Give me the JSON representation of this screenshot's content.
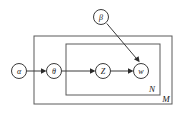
{
  "diagram": {
    "type": "plate-notation-graphical-model",
    "title": "",
    "colors": {
      "background": "#ffffff",
      "node_stroke": "#3b3b3b",
      "node_fill": "#ffffff",
      "plate_stroke": "#5a5a5a",
      "edge_stroke": "#3b3b3b",
      "text": "#1a1a1a"
    },
    "nodes": [
      {
        "id": "alpha",
        "label": "α",
        "cx": 19,
        "cy": 71,
        "r": 7.5
      },
      {
        "id": "theta",
        "label": "θ",
        "cx": 54,
        "cy": 71,
        "r": 7.5
      },
      {
        "id": "z",
        "label": "Z",
        "cx": 103,
        "cy": 71,
        "r": 7.5
      },
      {
        "id": "w",
        "label": "w",
        "cx": 141,
        "cy": 71,
        "r": 7.5
      },
      {
        "id": "beta",
        "label": "β",
        "cx": 101,
        "cy": 17,
        "r": 7.5
      }
    ],
    "edges": [
      {
        "id": "alpha-to-theta",
        "from": "alpha",
        "to": "theta"
      },
      {
        "id": "theta-to-z",
        "from": "theta",
        "to": "z"
      },
      {
        "id": "z-to-w",
        "from": "z",
        "to": "w"
      },
      {
        "id": "beta-to-w",
        "from": "beta",
        "to": "w"
      }
    ],
    "plates": [
      {
        "id": "plate-m",
        "label": "M",
        "x": 34,
        "y": 36,
        "width": 138,
        "height": 68,
        "label_x": 166,
        "label_y": 99
      },
      {
        "id": "plate-n",
        "label": "N",
        "x": 66,
        "y": 44,
        "width": 94,
        "height": 51,
        "label_x": 152,
        "label_y": 89
      }
    ]
  }
}
